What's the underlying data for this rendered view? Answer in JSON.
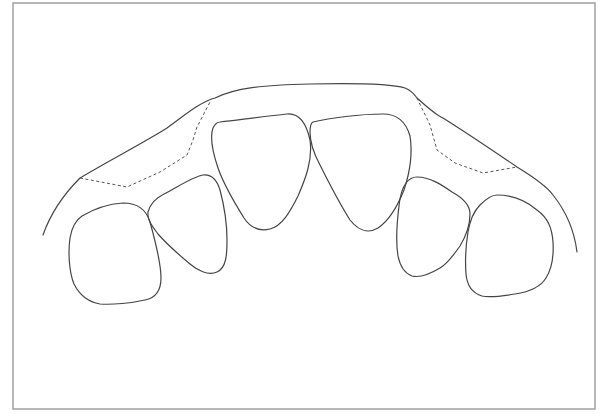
{
  "diagram": {
    "colors": {
      "frame": "#9a9a9a",
      "outline": "#454545",
      "dashed": "#555555",
      "background": "#ffffff"
    },
    "frame": {
      "x": 13,
      "y": 3,
      "width": 582,
      "height": 406
    },
    "arch": {
      "label": "outer-arch-contour",
      "path": "M43,235 C50,215 62,196 80,178 C110,160 145,142 167,128 C185,115 200,102 215,98 C235,88 262,85 310,84 C360,83 392,84 405,88 C412,91 415,95 417,98 C428,108 436,115 443,118 C470,135 495,152 517,167 C535,178 548,188 553,195 C565,210 574,228 577,252"
    },
    "dashed_lines": [
      {
        "label": "left-dashed-boundary",
        "path": "M80,178 L127,187 L160,172 L187,155 L193,140 L197,127 L210,102"
      },
      {
        "label": "right-dashed-boundary",
        "path": "M417,98 L430,125 L437,150 L455,163 L483,173 L500,170 L517,167"
      }
    ],
    "teeth": [
      {
        "name": "left-canine",
        "path": "M123,203 C140,203 147,212 150,222 C155,240 161,262 161,278 C161,292 155,298 145,300 C132,303 112,305 100,304 C88,302 80,296 74,284 C69,272 68,252 70,238 C72,226 76,220 82,216 C92,210 108,204 123,203 Z"
      },
      {
        "name": "left-lateral-incisor",
        "path": "M203,175 C212,174 217,180 220,190 C224,205 227,225 227,240 C227,256 226,268 217,272 C208,276 197,270 190,264 C178,254 165,242 158,234 C152,226 147,220 148,212 C150,204 156,198 164,194 C176,188 192,177 203,175 Z"
      },
      {
        "name": "left-central-incisor",
        "path": "M220,122 C245,119 268,116 287,114 C298,113 306,122 310,140 C313,160 305,180 298,196 C290,212 282,226 270,229 C258,232 250,227 244,218 C234,202 224,185 218,168 C212,150 210,136 213,128 C215,124 218,122 220,122 Z"
      },
      {
        "name": "right-central-incisor",
        "path": "M313,122 C330,118 360,114 383,114 C398,114 406,122 410,136 C413,155 410,172 404,190 C398,205 390,220 378,228 C368,234 358,230 350,220 C340,204 330,185 320,165 C313,152 310,140 310,132 C310,126 311,123 313,122 Z"
      },
      {
        "name": "right-lateral-incisor",
        "path": "M417,177 C430,177 442,185 452,192 C463,198 470,206 470,214 C470,226 466,236 460,246 C453,256 447,264 440,268 C430,274 420,278 412,276 C404,273 400,266 398,256 C396,244 397,222 399,206 C400,196 403,187 406,183 C409,179 413,177 417,177 Z"
      },
      {
        "name": "right-canine",
        "path": "M497,195 C512,195 525,200 537,210 C548,218 552,228 553,242 C554,258 551,270 546,278 C540,288 528,292 515,294 C503,296 490,298 482,296 C472,293 467,285 466,274 C465,260 466,244 468,232 C470,220 474,211 480,205 C486,199 491,195 497,195 Z"
      }
    ]
  }
}
